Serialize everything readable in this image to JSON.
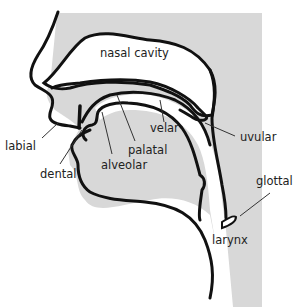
{
  "diagram": {
    "colors": {
      "background": "#ffffff",
      "tissue": "#d8d8d8",
      "outline": "#111111",
      "leader": "#333333",
      "text": "#222222"
    },
    "labels": {
      "nasal_cavity": "nasal cavity",
      "labial": "labial",
      "dental": "dental",
      "alveolar": "alveolar",
      "palatal": "palatal",
      "velar": "velar",
      "uvular": "uvular",
      "glottal": "glottal",
      "larynx": "larynx"
    }
  }
}
